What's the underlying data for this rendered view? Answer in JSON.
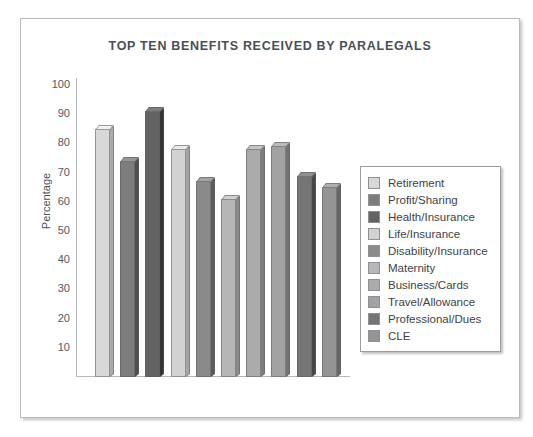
{
  "chart_data": {
    "type": "bar",
    "title": "TOP TEN BENEFITS RECEIVED BY PARALEGALS",
    "xlabel": "",
    "ylabel": "Percentage",
    "ylim": [
      0,
      100
    ],
    "yticks": [
      100,
      90,
      80,
      70,
      60,
      50,
      40,
      30,
      20,
      10
    ],
    "grid": false,
    "legend_position": "right",
    "categories": [
      "Retirement",
      "Profit/Sharing",
      "Health/Insurance",
      "Life/Insurance",
      "Disability/Insurance",
      "Maternity",
      "Business/Cards",
      "Travel/Allowance",
      "Professional/Dues",
      "CLE"
    ],
    "values": [
      85,
      74,
      91,
      78,
      67,
      61,
      78,
      79,
      69,
      65
    ],
    "colors": [
      "#d8d8d8",
      "#7d7d7d",
      "#636363",
      "#d2d2d2",
      "#8a8a8a",
      "#b6b6b6",
      "#ababab",
      "#a2a2a2",
      "#757575",
      "#949494"
    ]
  },
  "legend": {
    "items": [
      {
        "label": "Retirement",
        "color": "#d8d8d8"
      },
      {
        "label": "Profit/Sharing",
        "color": "#7d7d7d"
      },
      {
        "label": "Health/Insurance",
        "color": "#636363"
      },
      {
        "label": "Life/Insurance",
        "color": "#d2d2d2"
      },
      {
        "label": "Disability/Insurance",
        "color": "#8a8a8a"
      },
      {
        "label": "Maternity",
        "color": "#b6b6b6"
      },
      {
        "label": "Business/Cards",
        "color": "#ababab"
      },
      {
        "label": "Travel/Allowance",
        "color": "#a2a2a2"
      },
      {
        "label": "Professional/Dues",
        "color": "#757575"
      },
      {
        "label": "CLE",
        "color": "#949494"
      }
    ]
  }
}
